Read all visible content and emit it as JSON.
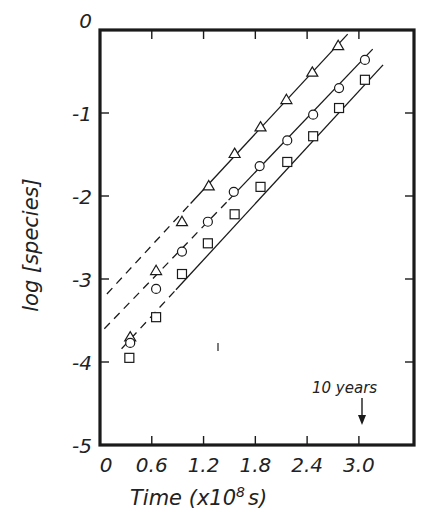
{
  "chart_data": {
    "type": "scatter",
    "title": "",
    "xlabel": "Time (x10^8 s)",
    "ylabel": "log [species]",
    "xlim": [
      0,
      3.6
    ],
    "ylim": [
      -5,
      0
    ],
    "x_ticks": [
      "0",
      "0.6",
      "1.2",
      "1.8",
      "2.4",
      "3.0"
    ],
    "x_tick_values": [
      0,
      0.6,
      1.2,
      1.8,
      2.4,
      3.0
    ],
    "y_ticks": [
      "0",
      "-1",
      "-2",
      "-3",
      "-4",
      "-5"
    ],
    "y_tick_values": [
      0,
      -1,
      -2,
      -3,
      -4,
      -5
    ],
    "grid": false,
    "legend": null,
    "annotations": [
      {
        "text": "10 years",
        "x": 3.05,
        "arrow_to_y": -4.8
      }
    ],
    "series": [
      {
        "name": "triangles",
        "marker": "triangle",
        "points": [
          {
            "x": 0.35,
            "y": -3.7
          },
          {
            "x": 0.65,
            "y": -2.9
          },
          {
            "x": 0.95,
            "y": -2.31
          },
          {
            "x": 1.26,
            "y": -1.88
          },
          {
            "x": 1.56,
            "y": -1.49
          },
          {
            "x": 1.86,
            "y": -1.17
          },
          {
            "x": 2.16,
            "y": -0.84
          },
          {
            "x": 2.46,
            "y": -0.51
          },
          {
            "x": 2.76,
            "y": -0.19
          }
        ],
        "fit_solid": {
          "x": [
            1.05,
            2.87
          ],
          "y": [
            -2.09,
            -0.05
          ]
        },
        "fit_dashed": {
          "x": [
            0.08,
            1.05
          ],
          "y": [
            -3.18,
            -2.09
          ]
        }
      },
      {
        "name": "circles",
        "marker": "circle",
        "points": [
          {
            "x": 0.35,
            "y": -3.77
          },
          {
            "x": 0.65,
            "y": -3.12
          },
          {
            "x": 0.95,
            "y": -2.67
          },
          {
            "x": 1.25,
            "y": -2.31
          },
          {
            "x": 1.55,
            "y": -1.95
          },
          {
            "x": 1.85,
            "y": -1.64
          },
          {
            "x": 2.17,
            "y": -1.33
          },
          {
            "x": 2.47,
            "y": -1.02
          },
          {
            "x": 2.77,
            "y": -0.7
          },
          {
            "x": 3.07,
            "y": -0.36
          }
        ],
        "fit_solid": {
          "x": [
            1.49,
            3.16
          ],
          "y": [
            -2.05,
            -0.23
          ]
        },
        "fit_dashed": {
          "x": [
            0.05,
            1.49
          ],
          "y": [
            -3.6,
            -2.05
          ]
        }
      },
      {
        "name": "squares",
        "marker": "square",
        "points": [
          {
            "x": 0.34,
            "y": -3.95
          },
          {
            "x": 0.65,
            "y": -3.46
          },
          {
            "x": 0.95,
            "y": -2.94
          },
          {
            "x": 1.25,
            "y": -2.57
          },
          {
            "x": 1.56,
            "y": -2.22
          },
          {
            "x": 1.86,
            "y": -1.89
          },
          {
            "x": 2.17,
            "y": -1.59
          },
          {
            "x": 2.47,
            "y": -1.28
          },
          {
            "x": 2.77,
            "y": -0.94
          },
          {
            "x": 3.07,
            "y": -0.6
          }
        ],
        "fit_solid": {
          "x": [
            0.88,
            3.28
          ],
          "y": [
            -3.13,
            -0.42
          ]
        },
        "fit_dashed": {
          "x": [
            0.25,
            0.88
          ],
          "y": [
            -3.84,
            -3.13
          ]
        }
      }
    ]
  },
  "labels": {
    "ylabel": "log [species]",
    "xlabel_main": "Time  (x10",
    "xlabel_exp": "8",
    "xlabel_tail": "s)",
    "annotation": "10 years"
  },
  "style": {
    "ink": "#1a1a1a",
    "background": "#ffffff"
  }
}
